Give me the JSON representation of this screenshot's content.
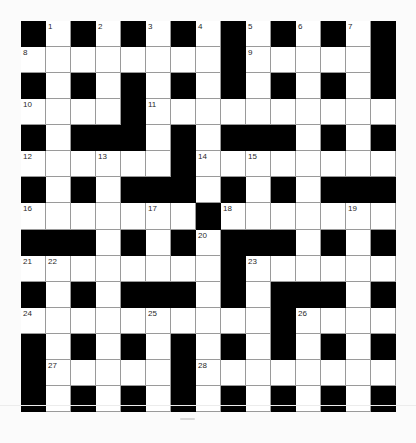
{
  "puzzle": {
    "rows": 15,
    "cols": 15,
    "layout": [
      "BWBWBWBWBWBWBWB",
      "WWWWWWWWBWWWWWB",
      "BWBWBWBWBWBWBWB",
      "WWWWBWWWWWWWWWW",
      "BWBBBWBWBBBWBWB",
      "WWWWWWBWWWWWWWW",
      "BWBWBBBWBWBWBBB",
      "WWWWWWWBWWWWWWW",
      "BBBWBWBWBBBWBWB",
      "WWWWWWWWBWWWWWW",
      "BWBWBBBWBWBBBWB",
      "WWWWWWWWWWBWWWW",
      "BWBWBWBWBWBWBWB",
      "BWWWWWBWWWWWWWW",
      "BWBWBWBWBWBWBWB"
    ],
    "numbers": [
      {
        "n": "1",
        "row": 0,
        "col": 1
      },
      {
        "n": "2",
        "row": 0,
        "col": 3
      },
      {
        "n": "3",
        "row": 0,
        "col": 5
      },
      {
        "n": "4",
        "row": 0,
        "col": 7
      },
      {
        "n": "5",
        "row": 0,
        "col": 9
      },
      {
        "n": "6",
        "row": 0,
        "col": 11
      },
      {
        "n": "7",
        "row": 0,
        "col": 13
      },
      {
        "n": "8",
        "row": 1,
        "col": 0
      },
      {
        "n": "9",
        "row": 1,
        "col": 9
      },
      {
        "n": "10",
        "row": 3,
        "col": 0
      },
      {
        "n": "11",
        "row": 3,
        "col": 5
      },
      {
        "n": "12",
        "row": 5,
        "col": 0
      },
      {
        "n": "13",
        "row": 5,
        "col": 3
      },
      {
        "n": "14",
        "row": 5,
        "col": 7
      },
      {
        "n": "15",
        "row": 5,
        "col": 9
      },
      {
        "n": "16",
        "row": 7,
        "col": 0
      },
      {
        "n": "17",
        "row": 7,
        "col": 5
      },
      {
        "n": "18",
        "row": 7,
        "col": 8
      },
      {
        "n": "19",
        "row": 7,
        "col": 13
      },
      {
        "n": "20",
        "row": 8,
        "col": 7
      },
      {
        "n": "21",
        "row": 9,
        "col": 0
      },
      {
        "n": "22",
        "row": 9,
        "col": 1
      },
      {
        "n": "23",
        "row": 9,
        "col": 9
      },
      {
        "n": "24",
        "row": 11,
        "col": 0
      },
      {
        "n": "25",
        "row": 11,
        "col": 5
      },
      {
        "n": "26",
        "row": 11,
        "col": 11
      },
      {
        "n": "27",
        "row": 13,
        "col": 1
      },
      {
        "n": "28",
        "row": 13,
        "col": 7
      }
    ],
    "entries_across": [
      {
        "n": "8",
        "length": 8
      },
      {
        "n": "9",
        "length": 5
      },
      {
        "n": "10",
        "length": 4
      },
      {
        "n": "11",
        "length": 10
      },
      {
        "n": "12",
        "length": 6
      },
      {
        "n": "14",
        "length": 8
      },
      {
        "n": "16",
        "length": 7
      },
      {
        "n": "18",
        "length": 7
      },
      {
        "n": "21",
        "length": 8
      },
      {
        "n": "23",
        "length": 6
      },
      {
        "n": "24",
        "length": 10
      },
      {
        "n": "26",
        "length": 4
      },
      {
        "n": "27",
        "length": 5
      },
      {
        "n": "28",
        "length": 8
      }
    ],
    "entries_down": [
      {
        "n": "1",
        "length": 8
      },
      {
        "n": "2",
        "length": 4
      },
      {
        "n": "3",
        "length": 6
      },
      {
        "n": "4",
        "length": 7
      },
      {
        "n": "5",
        "length": 4
      },
      {
        "n": "6",
        "length": 10
      },
      {
        "n": "7",
        "length": 6
      },
      {
        "n": "13",
        "length": 10
      },
      {
        "n": "15",
        "length": 3
      },
      {
        "n": "17",
        "length": 3
      },
      {
        "n": "19",
        "length": 8
      },
      {
        "n": "20",
        "length": 7
      },
      {
        "n": "22",
        "length": 6
      },
      {
        "n": "25",
        "length": 4
      },
      {
        "n": "26",
        "length": 4
      }
    ],
    "colors": {
      "block": "#000000",
      "cell": "#ffffff",
      "cell_border": "#9a9a9a",
      "number": "#2a2a2a",
      "page": "#fbfbfb"
    }
  }
}
